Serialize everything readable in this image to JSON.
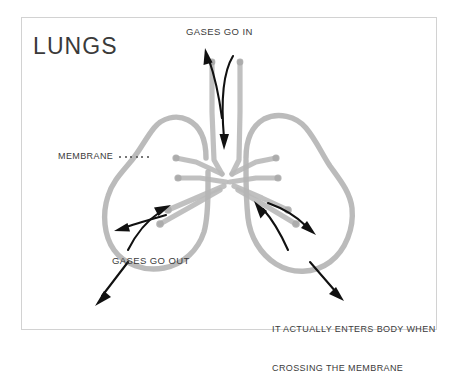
{
  "figure": {
    "title": "LUNGS",
    "border_color": "#d2d2d2",
    "background_color": "#ffffff",
    "organ_line_color": "#b5b5b5",
    "arrow_color": "#111111",
    "text_color": "#3b3b3b"
  },
  "labels": {
    "title": "LUNGS",
    "gases_in": "GASES GO IN",
    "membrane": "MEMBRANE",
    "gases_out": "GASES GO OUT",
    "enters_body_line1": "IT ACTUALLY ENTERS BODY WHEN",
    "enters_body_line2": "CROSSING THE MEMBRANE"
  },
  "annotations": {
    "membrane_leader_dots": 6,
    "arrows": [
      {
        "name": "trachea-inflow-arrow",
        "direction": "down",
        "meaning": "gases go in"
      },
      {
        "name": "trachea-outflow-arrow",
        "direction": "up-left",
        "meaning": "gases go out"
      },
      {
        "name": "left-lung-outflow-arrow",
        "direction": "up-right",
        "meaning": "gases go out"
      },
      {
        "name": "left-lung-outflow-arrow-2",
        "direction": "left",
        "meaning": "gases go out"
      },
      {
        "name": "left-membrane-crossing-arrow",
        "direction": "down-left",
        "meaning": "crossing the membrane"
      },
      {
        "name": "right-lung-inflow-arrow",
        "direction": "up-left",
        "meaning": "gases go in"
      },
      {
        "name": "right-lung-inflow-arrow-2",
        "direction": "right",
        "meaning": "gases go in"
      },
      {
        "name": "right-membrane-crossing-arrow",
        "direction": "down-right",
        "meaning": "crossing the membrane"
      }
    ]
  }
}
